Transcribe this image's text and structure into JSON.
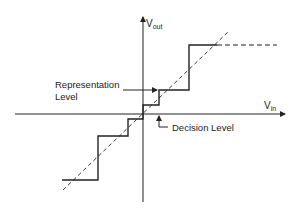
{
  "diagram": {
    "type": "quantizer transfer characteristic",
    "axes": {
      "y_label_main": "V",
      "y_label_sub": "out",
      "x_label_main": "V",
      "x_label_sub": "in"
    },
    "annotations": {
      "representation_level_line1": "Representation",
      "representation_level_line2": "Level",
      "decision_level": "Decision Level"
    },
    "colors": {
      "line": "#222222",
      "background": "#ffffff"
    }
  }
}
